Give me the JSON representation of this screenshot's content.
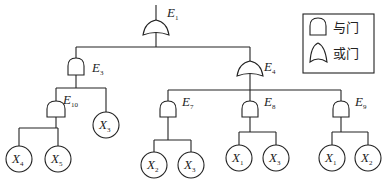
{
  "diagram": {
    "type": "fault-tree",
    "legend": {
      "and_gate_label": "与门",
      "or_gate_label": "或门"
    },
    "nodes": {
      "E1": {
        "letter": "E",
        "sub": "1",
        "gate": "or"
      },
      "E3": {
        "letter": "E",
        "sub": "3",
        "gate": "and"
      },
      "E4": {
        "letter": "E",
        "sub": "4",
        "gate": "or"
      },
      "E10": {
        "letter": "E",
        "sub": "10",
        "gate": "and"
      },
      "E7": {
        "letter": "E",
        "sub": "7",
        "gate": "and"
      },
      "E8": {
        "letter": "E",
        "sub": "8",
        "gate": "and"
      },
      "E9": {
        "letter": "E",
        "sub": "9",
        "gate": "and"
      },
      "b1": {
        "letter": "X",
        "sub": "4"
      },
      "b2": {
        "letter": "X",
        "sub": "5"
      },
      "b3": {
        "letter": "X",
        "sub": "3"
      },
      "b4": {
        "letter": "X",
        "sub": "2"
      },
      "b5": {
        "letter": "X",
        "sub": "3"
      },
      "b6": {
        "letter": "X",
        "sub": "1"
      },
      "b7": {
        "letter": "X",
        "sub": "3"
      },
      "b8": {
        "letter": "X",
        "sub": "1"
      },
      "b9": {
        "letter": "X",
        "sub": "2"
      }
    },
    "edges": [
      [
        "E1",
        "E3"
      ],
      [
        "E1",
        "E4"
      ],
      [
        "E3",
        "E10"
      ],
      [
        "E3",
        "b3"
      ],
      [
        "E10",
        "b1"
      ],
      [
        "E10",
        "b2"
      ],
      [
        "E4",
        "E7"
      ],
      [
        "E4",
        "E8"
      ],
      [
        "E4",
        "E9"
      ],
      [
        "E7",
        "b4"
      ],
      [
        "E7",
        "b5"
      ],
      [
        "E8",
        "b6"
      ],
      [
        "E8",
        "b7"
      ],
      [
        "E9",
        "b8"
      ],
      [
        "E9",
        "b9"
      ]
    ]
  }
}
